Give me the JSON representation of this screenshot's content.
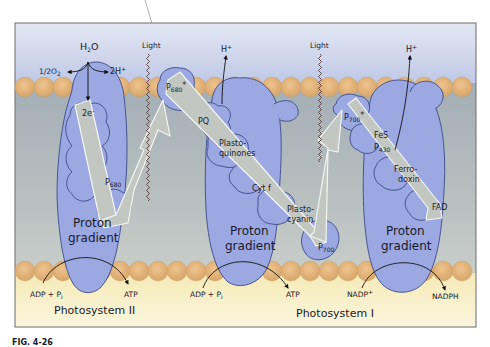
{
  "diagram": {
    "colors": {
      "stroma_top": "#c9d3ea",
      "lumen": "#a9b4b8",
      "lumen_light": "#c6cdcc",
      "bottom": "#f7efc4",
      "lipid": "#e3b47a",
      "protein": "#9aa7e0",
      "protein_stroke": "#3b4a8a",
      "arrow_fill": "#c4c9c4",
      "arrow_stroke": "#f2f4f2"
    },
    "top_labels": {
      "h2o": "H",
      "h2o_sub": "2",
      "h2o_tail": "O",
      "half_o2": "1/2O",
      "half_o2_sub": "2",
      "two_h": "2H",
      "two_h_sup": "+",
      "light_1": "Light",
      "light_2": "Light",
      "h_plus_1": "H",
      "h_plus_1_sup": "+",
      "h_plus_2": "H",
      "h_plus_2_sup": "+"
    },
    "ps2": {
      "two_e": "2e",
      "two_e_sup": "-",
      "p680": "P",
      "p680_sub": "680",
      "p680_star": "P",
      "p680_star_sub": "680",
      "star": "*",
      "gradient_line1": "Proton",
      "gradient_line2": "gradient"
    },
    "cytochrome": {
      "pq": "PQ",
      "plastoquinones_1": "Plasto-",
      "plastoquinones_2": "quinones",
      "cyt_f": "Cyt f",
      "plastocyanin_1": "Plasto-",
      "plastocyanin_2": "cyanin",
      "p700": "P",
      "p700_sub": "700",
      "gradient_line1": "Proton",
      "gradient_line2": "gradient"
    },
    "ps1": {
      "p700_star": "P",
      "p700_star_sub": "700",
      "star": "*",
      "fes": "FeS",
      "p430": "P",
      "p430_sub": "430",
      "ferredoxin_1": "Ferro-",
      "ferredoxin_2": "doxin",
      "fad": "FAD",
      "gradient_line1": "Proton",
      "gradient_line2": "gradient"
    },
    "bottom_labels": {
      "adp_pi_1": "ADP + P",
      "adp_pi_1_sub": "i",
      "atp_1": "ATP",
      "adp_pi_2": "ADP + P",
      "adp_pi_2_sub": "i",
      "atp_2": "ATP",
      "nadp": "NADP",
      "nadp_sup": "+",
      "nadph": "NADPH",
      "photosystem_2": "Photosystem II",
      "photosystem_1": "Photosystem I"
    },
    "caption": {
      "label": "FIG. 4-26"
    }
  }
}
